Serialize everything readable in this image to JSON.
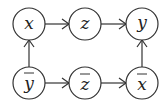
{
  "diagram": {
    "nodes": [
      {
        "id": "x",
        "label": "x",
        "bar": false
      },
      {
        "id": "z",
        "label": "z",
        "bar": false
      },
      {
        "id": "y",
        "label": "y",
        "bar": false
      },
      {
        "id": "ybar",
        "label": "y",
        "bar": true
      },
      {
        "id": "zbar",
        "label": "z",
        "bar": true
      },
      {
        "id": "xbar",
        "label": "x",
        "bar": true
      }
    ],
    "edges": [
      {
        "from": "x",
        "to": "z"
      },
      {
        "from": "z",
        "to": "y"
      },
      {
        "from": "ybar",
        "to": "x"
      },
      {
        "from": "ybar",
        "to": "zbar"
      },
      {
        "from": "zbar",
        "to": "xbar"
      },
      {
        "from": "xbar",
        "to": "y"
      }
    ]
  }
}
